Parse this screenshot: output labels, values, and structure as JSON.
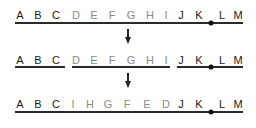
{
  "diagram": {
    "rows": [
      {
        "name": "original",
        "y": 10,
        "letters": [
          {
            "t": "A",
            "x": 20,
            "tone": "dark"
          },
          {
            "t": "B",
            "x": 38,
            "tone": "dark"
          },
          {
            "t": "C",
            "x": 56,
            "tone": "dark"
          },
          {
            "t": "D",
            "x": 76,
            "tone": "light"
          },
          {
            "t": "E",
            "x": 94,
            "tone": "light"
          },
          {
            "t": "F",
            "x": 112,
            "tone": "light"
          },
          {
            "t": "G",
            "x": 131,
            "tone": "light"
          },
          {
            "t": "H",
            "x": 150,
            "tone": "light"
          },
          {
            "t": "I",
            "x": 166,
            "tone": "light"
          },
          {
            "t": "J",
            "x": 181,
            "tone": "dark"
          },
          {
            "t": "K",
            "x": 199,
            "tone": "dark"
          },
          {
            "t": "L",
            "x": 222,
            "tone": "dark"
          },
          {
            "t": "M",
            "x": 238,
            "tone": "dark"
          }
        ],
        "lines": [
          {
            "x1": 15,
            "x2": 243
          }
        ],
        "line_y": 22,
        "centromere_x": 211
      },
      {
        "name": "broken",
        "y": 55,
        "letters": [
          {
            "t": "A",
            "x": 20,
            "tone": "dark"
          },
          {
            "t": "B",
            "x": 38,
            "tone": "dark"
          },
          {
            "t": "C",
            "x": 56,
            "tone": "dark"
          },
          {
            "t": "D",
            "x": 76,
            "tone": "light"
          },
          {
            "t": "E",
            "x": 94,
            "tone": "light"
          },
          {
            "t": "F",
            "x": 112,
            "tone": "light"
          },
          {
            "t": "G",
            "x": 131,
            "tone": "light"
          },
          {
            "t": "H",
            "x": 150,
            "tone": "light"
          },
          {
            "t": "I",
            "x": 166,
            "tone": "light"
          },
          {
            "t": "J",
            "x": 181,
            "tone": "dark"
          },
          {
            "t": "K",
            "x": 199,
            "tone": "dark"
          },
          {
            "t": "L",
            "x": 222,
            "tone": "dark"
          },
          {
            "t": "M",
            "x": 238,
            "tone": "dark"
          }
        ],
        "lines": [
          {
            "x1": 15,
            "x2": 65
          },
          {
            "x1": 72,
            "x2": 170
          },
          {
            "x1": 177,
            "x2": 243
          }
        ],
        "line_y": 66,
        "centromere_x": 211
      },
      {
        "name": "inverted",
        "y": 99,
        "letters": [
          {
            "t": "A",
            "x": 20,
            "tone": "dark"
          },
          {
            "t": "B",
            "x": 38,
            "tone": "dark"
          },
          {
            "t": "C",
            "x": 56,
            "tone": "dark"
          },
          {
            "t": "I",
            "x": 73,
            "tone": "light"
          },
          {
            "t": "H",
            "x": 90,
            "tone": "light"
          },
          {
            "t": "G",
            "x": 108,
            "tone": "light"
          },
          {
            "t": "F",
            "x": 127,
            "tone": "light"
          },
          {
            "t": "E",
            "x": 147,
            "tone": "light"
          },
          {
            "t": "D",
            "x": 166,
            "tone": "light"
          },
          {
            "t": "J",
            "x": 181,
            "tone": "dark"
          },
          {
            "t": "K",
            "x": 199,
            "tone": "dark"
          },
          {
            "t": "L",
            "x": 222,
            "tone": "dark"
          },
          {
            "t": "M",
            "x": 238,
            "tone": "dark"
          }
        ],
        "lines": [
          {
            "x1": 15,
            "x2": 243
          }
        ],
        "line_y": 111,
        "centromere_x": 211
      }
    ],
    "arrows": [
      {
        "x": 128,
        "y1": 29,
        "y2": 44
      },
      {
        "x": 128,
        "y1": 73,
        "y2": 88
      }
    ]
  }
}
